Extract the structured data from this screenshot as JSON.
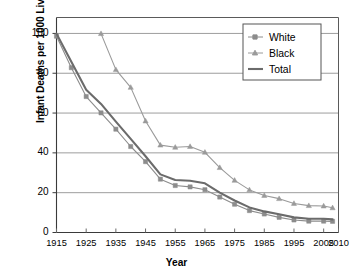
{
  "chart_data": {
    "type": "line",
    "title": "",
    "xlabel": "Year",
    "ylabel": "Infant Deaths per 1000 Live Births",
    "xlim": [
      1915,
      2010
    ],
    "ylim": [
      0,
      108
    ],
    "grid": true,
    "legend_position": "top-right-inside",
    "xticks": [
      1915,
      1925,
      1935,
      1945,
      1955,
      1965,
      1975,
      1985,
      1995,
      2005,
      2010
    ],
    "yticks": [
      0,
      20,
      40,
      60,
      80,
      100
    ],
    "series": [
      {
        "name": "White",
        "marker": "square",
        "color": "#8c8c8c",
        "x": [
          1915,
          1920,
          1925,
          1930,
          1935,
          1940,
          1945,
          1950,
          1955,
          1960,
          1965,
          1970,
          1975,
          1980,
          1985,
          1990,
          1995,
          2000,
          2005,
          2008
        ],
        "values": [
          98.6,
          82.8,
          68.3,
          60.1,
          51.9,
          43.2,
          35.6,
          26.8,
          23.6,
          22.9,
          21.5,
          17.8,
          14.2,
          11.0,
          9.3,
          7.6,
          6.3,
          5.7,
          5.7,
          5.6
        ]
      },
      {
        "name": "Black",
        "marker": "triangle",
        "color": "#9a9a9a",
        "x": [
          1930,
          1935,
          1940,
          1945,
          1950,
          1955,
          1960,
          1965,
          1970,
          1975,
          1980,
          1985,
          1990,
          1995,
          2000,
          2005,
          2008
        ],
        "values": [
          99.9,
          81.8,
          72.9,
          56.0,
          43.9,
          42.8,
          43.2,
          40.3,
          32.6,
          26.2,
          21.4,
          18.6,
          17.0,
          14.6,
          13.5,
          13.3,
          12.4
        ]
      },
      {
        "name": "Total",
        "marker": "none",
        "color": "#6b6b6b",
        "x": [
          1915,
          1920,
          1925,
          1930,
          1935,
          1940,
          1945,
          1950,
          1955,
          1960,
          1965,
          1970,
          1975,
          1980,
          1985,
          1990,
          1995,
          2000,
          2005,
          2008
        ],
        "values": [
          99.9,
          85.8,
          71.7,
          64.6,
          55.7,
          47.0,
          38.3,
          29.2,
          26.4,
          26.0,
          24.7,
          20.0,
          16.1,
          12.6,
          10.6,
          9.2,
          7.6,
          6.9,
          6.9,
          6.6
        ]
      }
    ]
  },
  "legend": {
    "items": [
      {
        "label": "White",
        "marker": "square"
      },
      {
        "label": "Black",
        "marker": "triangle"
      },
      {
        "label": "Total",
        "marker": "line"
      }
    ]
  }
}
